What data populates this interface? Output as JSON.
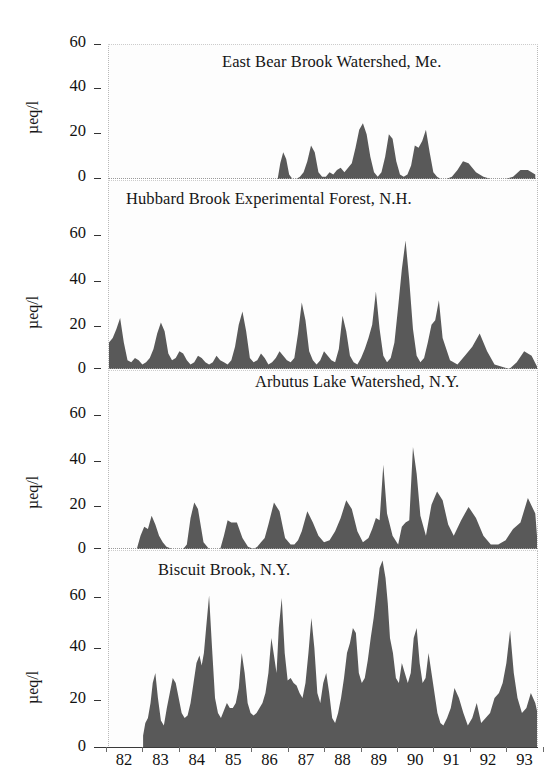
{
  "figure": {
    "y_axis_label": "µeq/l",
    "y_ticks": [
      "0",
      "20",
      "40",
      "60"
    ],
    "x_ticks": [
      "82",
      "83",
      "84",
      "85",
      "86",
      "87",
      "88",
      "89",
      "90",
      "91",
      "92",
      "93"
    ],
    "fill_color": "#595959",
    "background": "#ffffff"
  },
  "chart_data": [
    {
      "type": "area",
      "title": "East Bear Brook Watershed, Me.",
      "xlabel": "",
      "ylabel": "µeq/l",
      "ylim": [
        0,
        70
      ],
      "xlim": [
        1982.0,
        1993.6
      ],
      "yticks": [
        0,
        20,
        40,
        60
      ],
      "grid": false,
      "legend": "none",
      "x": [
        1986.55,
        1986.62,
        1986.7,
        1986.78,
        1986.86,
        1986.95,
        1987.05,
        1987.15,
        1987.25,
        1987.35,
        1987.45,
        1987.55,
        1987.65,
        1987.75,
        1987.85,
        1987.95,
        1988.05,
        1988.15,
        1988.25,
        1988.35,
        1988.45,
        1988.55,
        1988.65,
        1988.75,
        1988.85,
        1988.95,
        1989.05,
        1989.15,
        1989.25,
        1989.35,
        1989.45,
        1989.55,
        1989.65,
        1989.75,
        1989.85,
        1989.95,
        1990.05,
        1990.15,
        1990.25,
        1990.35,
        1990.45,
        1990.55,
        1990.65,
        1990.75,
        1990.85,
        1990.95,
        1991.1,
        1991.25,
        1991.4,
        1991.55,
        1991.7,
        1991.9,
        1992.1,
        1992.3,
        1992.5,
        1992.7,
        1992.9,
        1993.1,
        1993.3,
        1993.5
      ],
      "values": [
        0,
        7,
        12,
        9,
        2,
        0,
        0,
        1,
        3,
        8,
        15,
        12,
        3,
        1,
        1,
        3,
        2,
        4,
        5,
        3,
        5,
        7,
        14,
        22,
        25,
        20,
        10,
        3,
        1,
        3,
        10,
        20,
        18,
        8,
        2,
        1,
        2,
        6,
        15,
        14,
        17,
        22,
        12,
        3,
        1,
        0,
        0,
        1,
        4,
        8,
        7,
        3,
        1,
        0,
        0,
        0,
        1,
        4,
        4,
        2
      ]
    },
    {
      "type": "area",
      "title": "Hubbard Brook Experimental Forest, N.H.",
      "xlabel": "",
      "ylabel": "µeq/l",
      "ylim": [
        0,
        70
      ],
      "xlim": [
        1982.0,
        1993.6
      ],
      "yticks": [
        0,
        20,
        40,
        60
      ],
      "grid": false,
      "legend": "none",
      "x": [
        1982.0,
        1982.1,
        1982.2,
        1982.3,
        1982.4,
        1982.5,
        1982.6,
        1982.7,
        1982.8,
        1982.9,
        1983.0,
        1983.1,
        1983.2,
        1983.3,
        1983.4,
        1983.5,
        1983.6,
        1983.7,
        1983.8,
        1983.9,
        1984.0,
        1984.1,
        1984.2,
        1984.3,
        1984.4,
        1984.5,
        1984.6,
        1984.7,
        1984.8,
        1984.9,
        1985.0,
        1985.1,
        1985.2,
        1985.3,
        1985.4,
        1985.5,
        1985.6,
        1985.7,
        1985.8,
        1985.9,
        1986.0,
        1986.1,
        1986.2,
        1986.3,
        1986.4,
        1986.5,
        1986.6,
        1986.7,
        1986.8,
        1986.9,
        1987.0,
        1987.1,
        1987.2,
        1987.3,
        1987.4,
        1987.5,
        1987.6,
        1987.7,
        1987.8,
        1987.9,
        1988.0,
        1988.1,
        1988.2,
        1988.3,
        1988.4,
        1988.5,
        1988.6,
        1988.7,
        1988.8,
        1988.9,
        1989.0,
        1989.1,
        1989.2,
        1989.3,
        1989.4,
        1989.5,
        1989.6,
        1989.7,
        1989.8,
        1989.9,
        1990.0,
        1990.1,
        1990.2,
        1990.3,
        1990.4,
        1990.5,
        1990.6,
        1990.7,
        1990.8,
        1990.9,
        1991.0,
        1991.2,
        1991.4,
        1991.6,
        1991.8,
        1992.0,
        1992.2,
        1992.4,
        1992.6,
        1992.8,
        1993.0,
        1993.2,
        1993.4,
        1993.55
      ],
      "values": [
        12,
        14,
        18,
        23,
        12,
        4,
        3,
        5,
        4,
        2,
        3,
        5,
        9,
        16,
        21,
        17,
        7,
        4,
        5,
        8,
        7,
        4,
        2,
        3,
        6,
        5,
        3,
        2,
        3,
        6,
        4,
        3,
        2,
        4,
        10,
        20,
        26,
        17,
        5,
        3,
        4,
        7,
        5,
        2,
        3,
        5,
        8,
        6,
        4,
        3,
        5,
        16,
        30,
        22,
        8,
        4,
        2,
        4,
        8,
        6,
        4,
        3,
        9,
        24,
        17,
        6,
        3,
        2,
        5,
        9,
        14,
        20,
        35,
        18,
        6,
        3,
        5,
        12,
        28,
        45,
        58,
        40,
        18,
        6,
        3,
        5,
        12,
        20,
        22,
        31,
        14,
        4,
        2,
        6,
        10,
        16,
        8,
        2,
        1,
        0,
        3,
        8,
        6,
        1
      ]
    },
    {
      "type": "area",
      "title": "Arbutus Lake Watershed, N.Y.",
      "xlabel": "",
      "ylabel": "µeq/l",
      "ylim": [
        0,
        70
      ],
      "xlim": [
        1982.0,
        1993.6
      ],
      "yticks": [
        0,
        20,
        40,
        60
      ],
      "grid": false,
      "legend": "none",
      "x": [
        1982.75,
        1982.85,
        1982.95,
        1983.05,
        1983.15,
        1983.25,
        1983.35,
        1983.45,
        1983.55,
        1983.7,
        1983.85,
        1984.0,
        1984.1,
        1984.2,
        1984.3,
        1984.4,
        1984.55,
        1984.7,
        1984.85,
        1985.0,
        1985.1,
        1985.2,
        1985.3,
        1985.45,
        1985.6,
        1985.75,
        1985.9,
        1986.0,
        1986.1,
        1986.2,
        1986.3,
        1986.45,
        1986.6,
        1986.75,
        1986.9,
        1987.0,
        1987.1,
        1987.2,
        1987.35,
        1987.5,
        1987.65,
        1987.8,
        1987.95,
        1988.1,
        1988.25,
        1988.4,
        1988.55,
        1988.7,
        1988.85,
        1989.0,
        1989.1,
        1989.2,
        1989.3,
        1989.4,
        1989.5,
        1989.65,
        1989.8,
        1989.9,
        1990.0,
        1990.1,
        1990.2,
        1990.3,
        1990.4,
        1990.55,
        1990.7,
        1990.85,
        1991.0,
        1991.15,
        1991.3,
        1991.5,
        1991.7,
        1991.9,
        1992.1,
        1992.3,
        1992.5,
        1992.7,
        1992.9,
        1993.1,
        1993.3,
        1993.5,
        1993.55
      ],
      "values": [
        0,
        6,
        10,
        9,
        15,
        11,
        6,
        3,
        1,
        0,
        0,
        0,
        2,
        14,
        21,
        18,
        3,
        0,
        0,
        0,
        6,
        13,
        12,
        12,
        5,
        1,
        0,
        1,
        3,
        5,
        11,
        21,
        17,
        5,
        2,
        2,
        4,
        8,
        17,
        12,
        6,
        3,
        4,
        8,
        14,
        22,
        18,
        8,
        3,
        5,
        9,
        14,
        13,
        38,
        16,
        6,
        2,
        10,
        12,
        13,
        46,
        34,
        15,
        6,
        20,
        26,
        22,
        11,
        6,
        13,
        19,
        14,
        6,
        2,
        2,
        4,
        9,
        12,
        23,
        16,
        5
      ]
    },
    {
      "type": "area",
      "title": "Biscuit Brook, N.Y.",
      "xlabel": "",
      "ylabel": "µeq/l",
      "ylim": [
        0,
        80
      ],
      "xlim": [
        1982.0,
        1993.6
      ],
      "yticks": [
        0,
        20,
        40,
        60
      ],
      "grid": false,
      "legend": "none",
      "x": [
        1982.92,
        1982.98,
        1983.05,
        1983.12,
        1983.18,
        1983.25,
        1983.32,
        1983.4,
        1983.48,
        1983.56,
        1983.64,
        1983.72,
        1983.8,
        1983.88,
        1983.96,
        1984.04,
        1984.12,
        1984.2,
        1984.28,
        1984.36,
        1984.44,
        1984.5,
        1984.56,
        1984.62,
        1984.7,
        1984.78,
        1984.86,
        1984.94,
        1985.02,
        1985.1,
        1985.18,
        1985.26,
        1985.34,
        1985.42,
        1985.5,
        1985.58,
        1985.66,
        1985.74,
        1985.82,
        1985.9,
        1985.98,
        1986.06,
        1986.14,
        1986.22,
        1986.3,
        1986.38,
        1986.46,
        1986.52,
        1986.58,
        1986.66,
        1986.74,
        1986.82,
        1986.9,
        1986.98,
        1987.06,
        1987.14,
        1987.22,
        1987.3,
        1987.38,
        1987.46,
        1987.54,
        1987.62,
        1987.7,
        1987.78,
        1987.86,
        1987.94,
        1988.02,
        1988.1,
        1988.18,
        1988.26,
        1988.34,
        1988.42,
        1988.5,
        1988.58,
        1988.66,
        1988.74,
        1988.82,
        1988.9,
        1988.98,
        1989.06,
        1989.14,
        1989.22,
        1989.3,
        1989.38,
        1989.46,
        1989.52,
        1989.58,
        1989.66,
        1989.74,
        1989.82,
        1989.9,
        1989.98,
        1990.06,
        1990.14,
        1990.22,
        1990.3,
        1990.38,
        1990.46,
        1990.54,
        1990.62,
        1990.7,
        1990.78,
        1990.86,
        1990.94,
        1991.02,
        1991.12,
        1991.22,
        1991.32,
        1991.44,
        1991.56,
        1991.68,
        1991.8,
        1991.92,
        1992.04,
        1992.16,
        1992.28,
        1992.4,
        1992.52,
        1992.62,
        1992.72,
        1992.82,
        1992.92,
        1993.02,
        1993.14,
        1993.26,
        1993.38,
        1993.5,
        1993.56
      ],
      "values": [
        5,
        10,
        12,
        18,
        26,
        30,
        20,
        11,
        9,
        16,
        22,
        28,
        26,
        20,
        14,
        12,
        13,
        18,
        26,
        34,
        37,
        33,
        38,
        48,
        61,
        40,
        20,
        14,
        12,
        15,
        18,
        16,
        16,
        18,
        24,
        38,
        30,
        18,
        14,
        13,
        14,
        16,
        18,
        22,
        30,
        44,
        36,
        30,
        48,
        60,
        38,
        27,
        28,
        26,
        25,
        22,
        20,
        26,
        38,
        52,
        40,
        22,
        18,
        26,
        30,
        22,
        12,
        10,
        14,
        20,
        28,
        38,
        42,
        48,
        46,
        30,
        26,
        28,
        35,
        44,
        52,
        62,
        72,
        75,
        68,
        58,
        44,
        38,
        28,
        26,
        34,
        30,
        26,
        30,
        44,
        48,
        34,
        26,
        28,
        38,
        30,
        22,
        14,
        10,
        9,
        12,
        16,
        24,
        20,
        14,
        9,
        12,
        18,
        10,
        12,
        14,
        20,
        22,
        26,
        34,
        47,
        30,
        20,
        14,
        16,
        22,
        18,
        14,
        15
      ]
    }
  ]
}
